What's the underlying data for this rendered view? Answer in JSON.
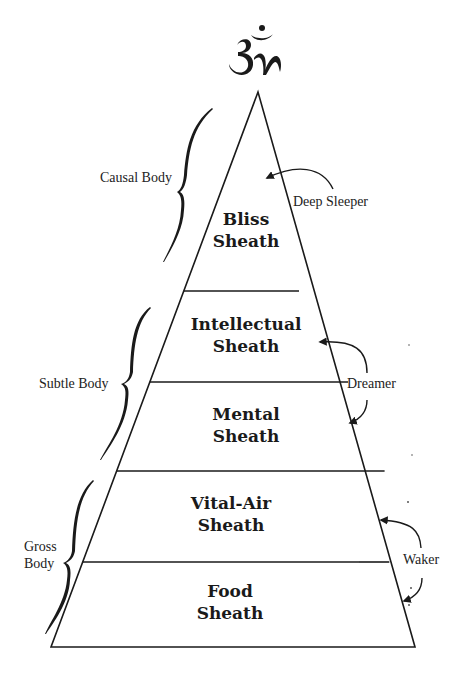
{
  "symbol": {
    "name": "Om",
    "glyph": "ॐ"
  },
  "sheaths": [
    {
      "label_line1": "Bliss",
      "label_line2": "Sheath"
    },
    {
      "label_line1": "Intellectual",
      "label_line2": "Sheath"
    },
    {
      "label_line1": "Mental",
      "label_line2": "Sheath"
    },
    {
      "label_line1": "Vital-Air",
      "label_line2": "Sheath"
    },
    {
      "label_line1": "Food",
      "label_line2": "Sheath"
    }
  ],
  "bodies": {
    "causal": "Causal Body",
    "subtle": "Subtle Body",
    "gross_line1": "Gross",
    "gross_line2": "Body"
  },
  "states": {
    "deep_sleeper": "Deep Sleeper",
    "dreamer": "Dreamer",
    "waker": "Waker"
  },
  "colors": {
    "ink": "#1a1a1a",
    "background": "#ffffff"
  }
}
